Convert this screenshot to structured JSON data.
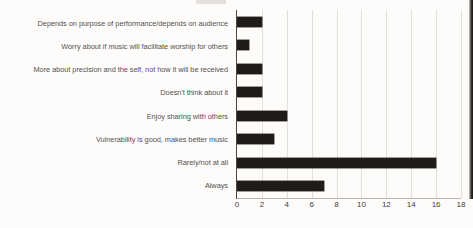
{
  "chart_data": {
    "type": "bar",
    "orientation": "horizontal",
    "title": "",
    "subtitle": "",
    "xlabel": "",
    "ylabel": "",
    "categories": [
      "Depends on purpose of performance/depends on audience",
      "Worry about if music will facilitate worship for others",
      "More about precision and the self, not how it will be received",
      "Doesn't think about it",
      "Enjoy sharing with others",
      "Vulnerability is good, makes better music",
      "Rarely/not at all",
      "Always"
    ],
    "values": [
      2,
      1,
      2,
      2,
      4,
      3,
      16,
      7
    ],
    "xlim": [
      0,
      18
    ],
    "xticks": [
      0,
      2,
      4,
      6,
      8,
      10,
      12,
      14,
      16,
      18
    ],
    "xtick_labels": [
      "0",
      "2",
      "4",
      "6",
      "8",
      "10",
      "12",
      "14",
      "16",
      "18"
    ],
    "grid": "vertical",
    "legend": "none",
    "bar_color": "#211c18",
    "gridline_color": "#e2e0dd",
    "axis_color": "#4a4744",
    "label_color": "#54514e",
    "background_color": "#fdfcfa"
  }
}
